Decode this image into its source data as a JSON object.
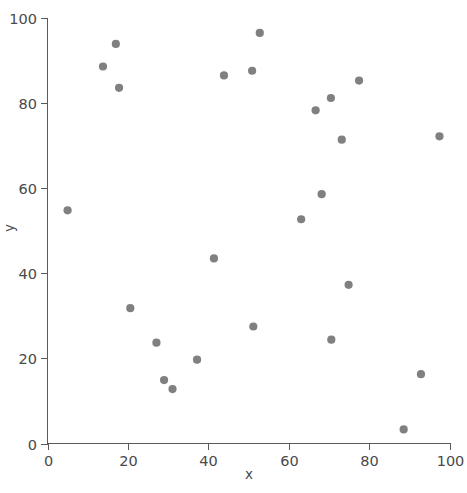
{
  "chart_data": {
    "type": "scatter",
    "title": "",
    "xlabel": "x",
    "ylabel": "y",
    "xlim": [
      0,
      100
    ],
    "ylim": [
      0,
      100
    ],
    "grid": false,
    "legend": null,
    "marker_color": "#6e6e6e",
    "marker_size": 7,
    "n_points": 25,
    "x_ticks": [
      0,
      20,
      40,
      60,
      80,
      100
    ],
    "y_ticks": [
      0,
      20,
      40,
      60,
      80,
      100
    ],
    "x_tick_labels": [
      "0",
      "20",
      "40",
      "60",
      "80",
      "100"
    ],
    "y_tick_labels": [
      "0",
      "20",
      "40",
      "60",
      "80",
      "100"
    ],
    "series": [
      {
        "name": "points",
        "points": [
          [
            5.0,
            54.8
          ],
          [
            13.8,
            88.6
          ],
          [
            17.0,
            93.9
          ],
          [
            17.8,
            83.6
          ],
          [
            20.6,
            31.8
          ],
          [
            27.1,
            23.7
          ],
          [
            29.0,
            14.9
          ],
          [
            31.1,
            12.8
          ],
          [
            37.2,
            19.7
          ],
          [
            41.4,
            43.5
          ],
          [
            43.9,
            86.5
          ],
          [
            50.9,
            87.6
          ],
          [
            51.2,
            27.5
          ],
          [
            52.8,
            96.5
          ],
          [
            63.1,
            52.7
          ],
          [
            66.7,
            78.3
          ],
          [
            68.2,
            58.6
          ],
          [
            70.5,
            81.2
          ],
          [
            70.6,
            24.4
          ],
          [
            73.2,
            71.4
          ],
          [
            74.9,
            37.3
          ],
          [
            77.5,
            85.3
          ],
          [
            88.6,
            3.3
          ],
          [
            92.9,
            16.3
          ],
          [
            97.5,
            72.2
          ]
        ]
      }
    ]
  },
  "axes": {
    "x_axis_label": "x",
    "y_axis_label": "y"
  }
}
